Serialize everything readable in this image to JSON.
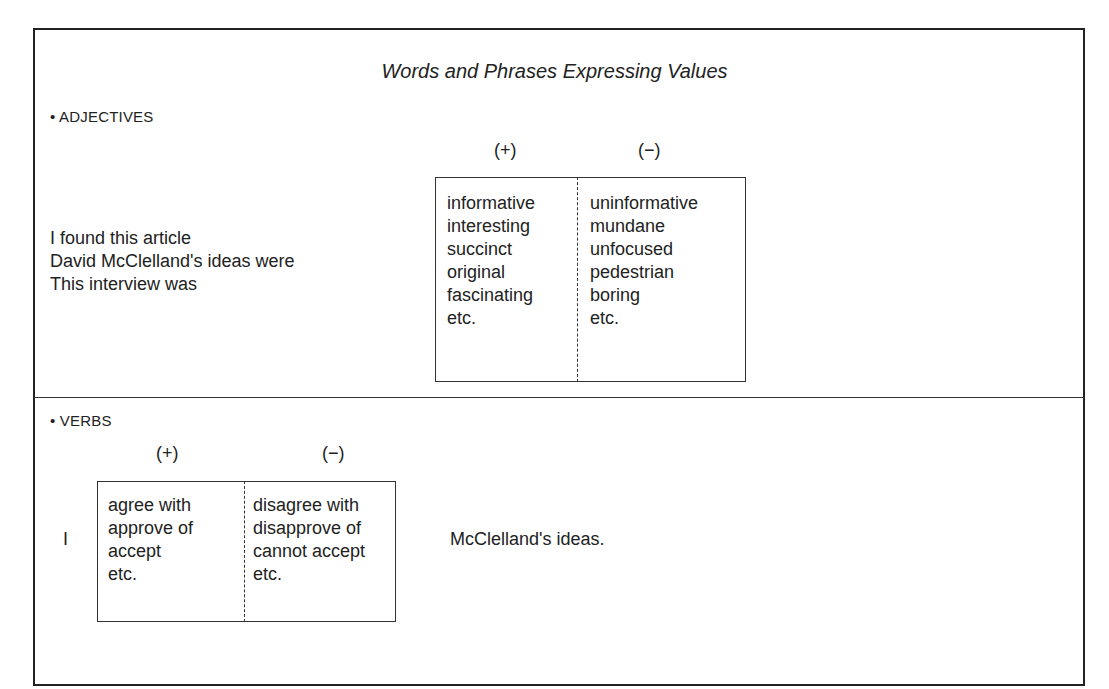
{
  "title": "Words and Phrases Expressing Values",
  "adjectives": {
    "heading": "• ADJECTIVES",
    "plus_label": "(+)",
    "minus_label": "(−)",
    "stems": [
      "I found this article",
      "David McClelland's ideas were",
      "This interview was"
    ],
    "positive": [
      "informative",
      "interesting",
      "succinct",
      "original",
      "fascinating",
      "etc."
    ],
    "negative": [
      "uninformative",
      "mundane",
      "unfocused",
      "pedestrian",
      "boring",
      "etc."
    ]
  },
  "verbs": {
    "heading": "• VERBS",
    "plus_label": "(+)",
    "minus_label": "(−)",
    "subject": "I",
    "positive": [
      "agree with",
      "approve of",
      "accept",
      "etc."
    ],
    "negative": [
      "disagree with",
      "disapprove of",
      "cannot accept",
      "etc."
    ],
    "object": "McClelland's ideas."
  }
}
